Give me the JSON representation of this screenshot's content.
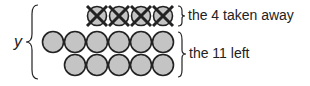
{
  "diagram": {
    "variable": "y",
    "labels": {
      "taken": "the 4 taken away",
      "left": "the 11 left"
    },
    "rows": [
      {
        "count": 4,
        "crossed": true,
        "start_x": 97,
        "cy": 16
      },
      {
        "count": 6,
        "crossed": false,
        "start_x": 53,
        "cy": 42
      },
      {
        "count": 5,
        "crossed": false,
        "start_x": 75,
        "cy": 65
      }
    ],
    "colors": {
      "fill": "#c4c4c4",
      "stroke": "#222222"
    }
  }
}
